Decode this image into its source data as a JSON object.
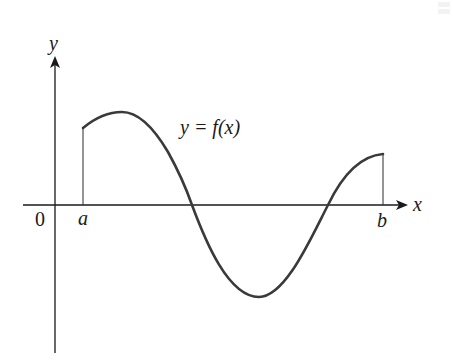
{
  "diagram": {
    "type": "function-graph",
    "x_axis_label": "x",
    "y_axis_label": "y",
    "origin_label": "0",
    "left_bound_label": "a",
    "right_bound_label": "b",
    "curve_label": "y = f(x)",
    "curve_color": "#3a3a3a",
    "axis_color": "#1a1a1a"
  }
}
